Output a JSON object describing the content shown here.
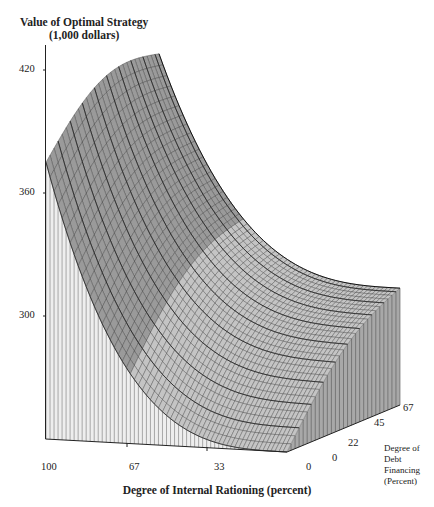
{
  "chart_data": {
    "type": "surface3d",
    "title": "Value of Optimal Strategy",
    "subtitle": "(1,000 dollars)",
    "xlabel": "Degree of Internal Rationing (percent)",
    "ylabel_lines": [
      "Degree of",
      "Debt",
      "Financing",
      "(Percent)"
    ],
    "zlabel": "Value of Optimal Strategy (1,000 dollars)",
    "x_ticks": [
      "100",
      "67",
      "33",
      "0"
    ],
    "y_ticks": [
      "0",
      "22",
      "45",
      "67"
    ],
    "z_ticks": [
      "420",
      "360",
      "300"
    ],
    "zlim": [
      240,
      430
    ],
    "x_range": [
      100,
      0
    ],
    "y_range": [
      0,
      67
    ],
    "grid": false,
    "surface": {
      "description": "Value declines convexly as internal rationing decreases from 100 to 0; value rises with degree of debt financing.",
      "x": [
        100,
        67,
        33,
        0
      ],
      "y": [
        0,
        22,
        45,
        67
      ],
      "z": [
        [
          375,
          392,
          405,
          418
        ],
        [
          300,
          310,
          318,
          330
        ],
        [
          262,
          275,
          286,
          298
        ],
        [
          240,
          258,
          275,
          297
        ]
      ]
    }
  },
  "labels": {
    "title_line1": "Value of Optimal Strategy",
    "title_line2": "(1,000 dollars)",
    "z_tick_420": "420",
    "z_tick_360": "360",
    "z_tick_300": "300",
    "x_tick_100": "100",
    "x_tick_67": "67",
    "x_tick_33": "33",
    "x_tick_0": "0",
    "y_tick_0": "0",
    "y_tick_22": "22",
    "y_tick_45": "45",
    "y_tick_67": "67",
    "xlabel": "Degree of Internal Rationing (percent)",
    "ylabel_1": "Degree of",
    "ylabel_2": "Debt",
    "ylabel_3": "Financing",
    "ylabel_4": "(Percent)"
  }
}
